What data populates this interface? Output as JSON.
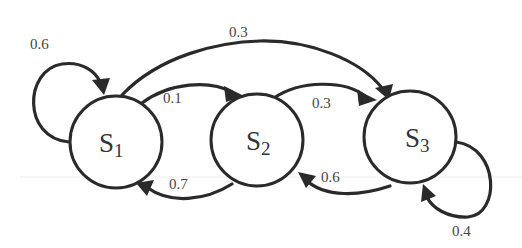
{
  "diagram": {
    "type": "markov-chain-state-transition",
    "states": [
      {
        "id": "S1",
        "letter": "S",
        "subscript": "1",
        "cx": 116,
        "cy": 142
      },
      {
        "id": "S2",
        "letter": "S",
        "subscript": "2",
        "cx": 257,
        "cy": 140
      },
      {
        "id": "S3",
        "letter": "S",
        "subscript": "3",
        "cx": 410,
        "cy": 137
      }
    ],
    "transitions": [
      {
        "from": "S1",
        "to": "S1",
        "label": "0.6"
      },
      {
        "from": "S1",
        "to": "S2",
        "label": "0.1"
      },
      {
        "from": "S1",
        "to": "S3",
        "label": "0.3"
      },
      {
        "from": "S2",
        "to": "S1",
        "label": "0.7"
      },
      {
        "from": "S2",
        "to": "S3",
        "label": "0.3"
      },
      {
        "from": "S3",
        "to": "S2",
        "label": "0.6"
      },
      {
        "from": "S3",
        "to": "S3",
        "label": "0.4"
      }
    ],
    "colors": {
      "stroke": "#2a2a2a",
      "background": "#ffffff",
      "text": "#333333"
    }
  }
}
